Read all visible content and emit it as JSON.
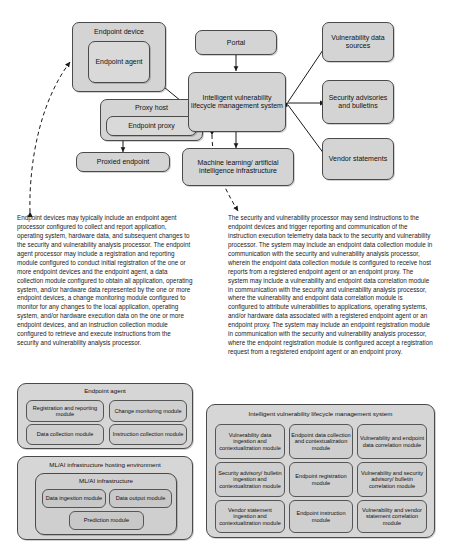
{
  "diagram": {
    "nodes": {
      "endpoint_device": "Endpoint device",
      "endpoint_agent": "Endpoint agent",
      "proxy_host": "Proxy host",
      "endpoint_proxy": "Endpoint proxy",
      "proxied_endpoint": "Proxied endpoint",
      "portal": "Portal",
      "hub": "Intelligent vulnerability lifecycle management system",
      "ml_ai": "Machine learning/ artificial intelligence infrastructure",
      "vuln_data_sources": "Vulnerability data sources",
      "security_advisories": "Security advisories and bulletins",
      "vendor_statements": "Vendor statements"
    }
  },
  "paragraphs": {
    "left": "Endpoint devices may typically include an endpoint agent processor configured to collect and report application, operating system, hardware data, and subsequent changes to the security and vulnerability analysis processor. The endpoint agent processor may include a registration and reporting module configured to conduct initial registration of the one or more endpoint devices and the endpoint agent, a data collection module configured to obtain all application, operating system, and/or hardware data represented by the one or more endpoint devices, a change monitoring module configured to monitor for any changes to the local application, operating system, and/or hardware execution data on the one or more endpoint devices, and an instruction collection module configured to retrieve and execute instructions from the security and vulnerability analysis processor.",
    "right": "The security and vulnerability processor may send instructions to the endpoint devices and trigger reporting and communication of the instruction execution telemetry data back to the security and vulnerability processor. The system may include an endpoint data collection module in communication with the security and vulnerability analysis processor, wherein the endpoint data collection module is configured to receive host reports from a registered endpoint agent or an endpoint proxy. The system may include a vulnerability and endpoint data correlation module in communication with the security and vulnerability analysis processor, where the vulnerability and endpoint data correlation module is configured to attribute vulnerabilities to applications, operating systems, and/or hardware data associated with a registered endpoint agent or an endpoint proxy. The system may include an endpoint registration module in communication with the security and vulnerability analysis processor, where the endpoint registration module is configured accept a registration request from a registered endpoint agent or an endpoint proxy."
  },
  "endpoint_agent_panel": {
    "title": "Endpoint agent",
    "modules": [
      "Registration and reporting module",
      "Change monitoring module",
      "Data collection module",
      "Instruction collection module"
    ]
  },
  "mlai_panel": {
    "title": "ML/AI infrastructure hosting environment",
    "subtitle": "ML/AI infrastructure",
    "modules": [
      "Data ingestion module",
      "Data output module",
      "Prediction module"
    ]
  },
  "system_panel": {
    "title": "Intelligent vulnerability lifecycle management system",
    "modules": [
      "Vulnerability data ingestion and contextualization module",
      "Endpoint data collection and contextualization module",
      "Vulnerability and endpoint data correlation module",
      "Security advisory/ bulletin ingestion and contextualization module",
      "Endpoint registration module",
      "Vulnerability and security advisory/ bulletin correlation module",
      "Vendor statement ingestion and contextualization module",
      "Endpoint instruction module",
      "Vulnerability and vendor statement correlation module"
    ]
  },
  "colors": {
    "box_fill": "#d4d4d4",
    "inner_fill": "#cfcfcf",
    "stroke": "#4a4a4a",
    "text": "#111111",
    "background": "#ffffff"
  }
}
